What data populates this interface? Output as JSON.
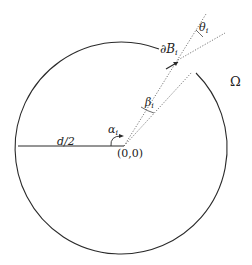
{
  "diagram": {
    "type": "geometry",
    "labels": {
      "radius": "d/2",
      "origin": "(0,0)",
      "alpha": "α",
      "alpha_sub": "i",
      "beta": "β",
      "beta_sub": "i",
      "theta": "θ",
      "theta_sub": "i",
      "boundary": "∂B",
      "boundary_sub": "i",
      "domain": "Ω"
    },
    "colors": {
      "stroke": "#2a2a2a",
      "dotted": "#555555"
    }
  }
}
